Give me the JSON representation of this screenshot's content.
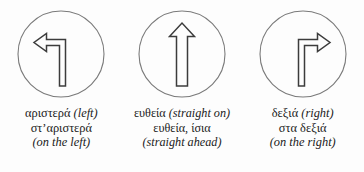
{
  "figure": {
    "background_color": "#fdfdfd",
    "stroke_color": "#3c3c3c",
    "circle_color": "#7a7a7a",
    "text_color": "#1b1b1b"
  },
  "columns": [
    {
      "icon_name": "turn-left-arrow-icon",
      "caption": {
        "line1_greek": "αριστερά ",
        "line1_english": "(left)",
        "line2_greek": "στ’αριστερά",
        "line2_english": "",
        "line3_greek": "",
        "line3_english": "(on the left)"
      }
    },
    {
      "icon_name": "straight-ahead-arrow-icon",
      "caption": {
        "line1_greek": "ευθεία ",
        "line1_english": "(straight on)",
        "line2_greek": "ευθεία, ίσια",
        "line2_english": "",
        "line3_greek": "",
        "line3_english": "(straight ahead)"
      }
    },
    {
      "icon_name": "turn-right-arrow-icon",
      "caption": {
        "line1_greek": "δεξιά ",
        "line1_english": "(right)",
        "line2_greek": "στα δεξιά",
        "line2_english": "",
        "line3_greek": "",
        "line3_english": "(on the right)"
      }
    }
  ]
}
